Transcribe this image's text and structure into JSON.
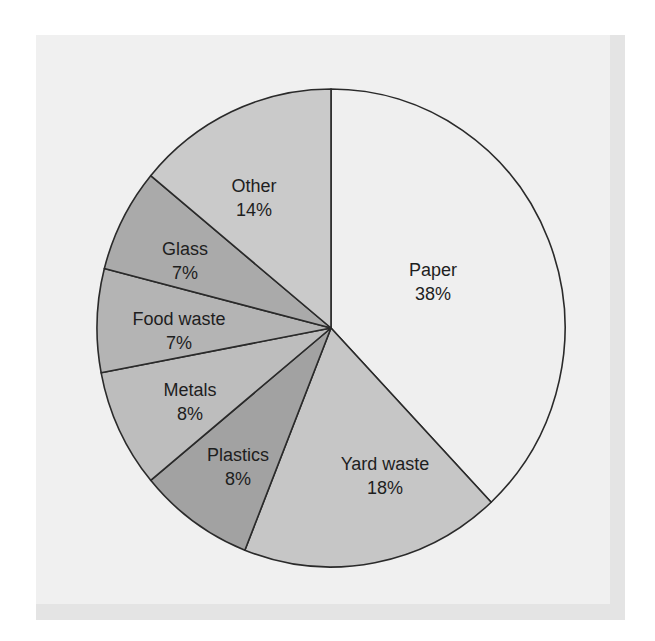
{
  "chart_data": {
    "type": "pie",
    "title": "",
    "start_angle": "12 o'clock",
    "direction": "clockwise",
    "categories": [
      "Paper",
      "Yard waste",
      "Plastics",
      "Metals",
      "Food waste",
      "Glass",
      "Other"
    ],
    "values": [
      38,
      18,
      8,
      8,
      7,
      7,
      14
    ],
    "unit": "%",
    "slices": [
      {
        "name": "Paper",
        "value": 38,
        "label": "Paper",
        "pct": "38%",
        "color": "#efefef"
      },
      {
        "name": "Yard waste",
        "value": 18,
        "label": "Yard waste",
        "pct": "18%",
        "color": "#c6c6c6"
      },
      {
        "name": "Plastics",
        "value": 8,
        "label": "Plastics",
        "pct": "8%",
        "color": "#a2a2a2"
      },
      {
        "name": "Metals",
        "value": 8,
        "label": "Metals",
        "pct": "8%",
        "color": "#bdbdbd"
      },
      {
        "name": "Food waste",
        "value": 7,
        "label": "Food waste",
        "pct": "7%",
        "color": "#b4b4b4"
      },
      {
        "name": "Glass",
        "value": 7,
        "label": "Glass",
        "pct": "7%",
        "color": "#aaaaaa"
      },
      {
        "name": "Other",
        "value": 14,
        "label": "Other",
        "pct": "14%",
        "color": "#cacaca"
      }
    ],
    "legend": "none (labels inside slices)",
    "grid": false
  },
  "colors": {
    "frame_border": "#e4e4e4",
    "panel_background": "#f0f0f0",
    "slice_stroke": "#2a2a2a",
    "label_text": "#1e1e1e"
  }
}
